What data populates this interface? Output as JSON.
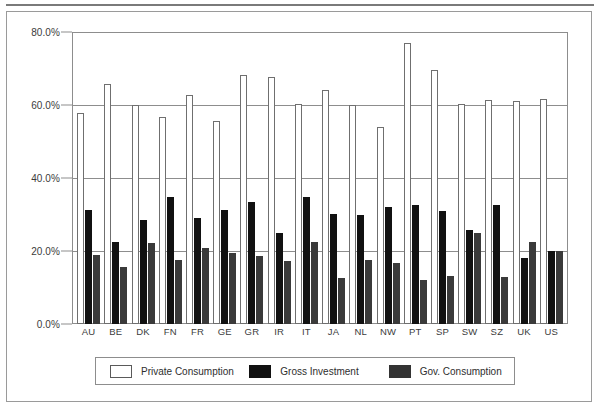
{
  "chart_data": {
    "type": "bar",
    "title": "",
    "xlabel": "",
    "ylabel": "",
    "ylim": [
      0,
      80
    ],
    "ytick_labels": [
      "0.0%",
      "20.0%",
      "40.0%",
      "60.0%",
      "80.0%"
    ],
    "ytick_values": [
      0,
      20,
      40,
      60,
      80
    ],
    "grid": true,
    "legend_position": "bottom",
    "categories": [
      "AU",
      "BE",
      "DK",
      "FN",
      "FR",
      "GE",
      "GR",
      "IR",
      "IT",
      "JA",
      "NL",
      "NW",
      "PT",
      "SP",
      "SW",
      "SZ",
      "UK",
      "US"
    ],
    "series": [
      {
        "name": "Private Consumption",
        "color": "#ffffff",
        "values": [
          57.8,
          65.8,
          60.0,
          56.8,
          62.7,
          55.5,
          68.3,
          67.7,
          60.2,
          64.1,
          60.0,
          54.0,
          76.9,
          69.6,
          60.2,
          61.4,
          61.1,
          61.6
        ]
      },
      {
        "name": "Gross Investment",
        "color": "#111111",
        "values": [
          31.3,
          22.6,
          28.6,
          34.9,
          29.0,
          31.2,
          33.4,
          25.0,
          34.7,
          30.1,
          30.0,
          32.0,
          32.5,
          31.0,
          25.8,
          32.7,
          18.0,
          20.0
        ]
      },
      {
        "name": "Gov. Consumption",
        "color": "#3a3a3a",
        "values": [
          18.9,
          15.5,
          22.2,
          17.6,
          20.8,
          19.4,
          18.5,
          17.2,
          22.6,
          12.7,
          17.6,
          16.8,
          12.0,
          13.2,
          24.8,
          12.9,
          22.5,
          20.0
        ]
      }
    ]
  },
  "legend": {
    "items": [
      {
        "label": "Private Consumption",
        "key": "private"
      },
      {
        "label": "Gross Investment",
        "key": "gross"
      },
      {
        "label": "Gov. Consumption",
        "key": "gov"
      }
    ]
  }
}
